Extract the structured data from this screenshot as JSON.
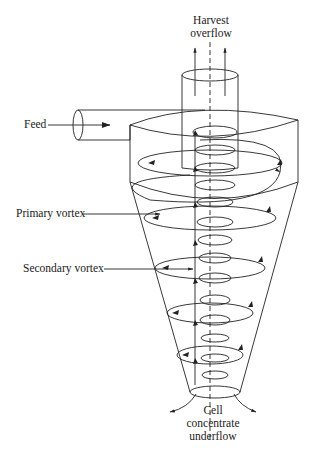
{
  "diagram": {
    "type": "hydrocyclone cross-section",
    "labels": {
      "harvest_line1": "Harvest",
      "harvest_line2": "overflow",
      "feed": "Feed",
      "primary_vortex": "Primary vortex",
      "secondary_vortex": "Secondary vortex",
      "underflow_line1": "Cell",
      "underflow_line2": "concentrate",
      "underflow_line3": "underflow"
    },
    "colors": {
      "stroke": "#222222",
      "background": "#ffffff"
    }
  }
}
